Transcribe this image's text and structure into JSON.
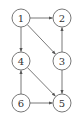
{
  "diagram": {
    "type": "directed-graph",
    "nodes": [
      {
        "id": "1",
        "label": "1",
        "x": 21,
        "y": 18
      },
      {
        "id": "2",
        "label": "2",
        "x": 62,
        "y": 18
      },
      {
        "id": "3",
        "label": "3",
        "x": 62,
        "y": 61
      },
      {
        "id": "4",
        "label": "4",
        "x": 21,
        "y": 61
      },
      {
        "id": "5",
        "label": "5",
        "x": 62,
        "y": 103
      },
      {
        "id": "6",
        "label": "6",
        "x": 21,
        "y": 103
      }
    ],
    "edges": [
      {
        "from": "1",
        "to": "2"
      },
      {
        "from": "1",
        "to": "4"
      },
      {
        "from": "1",
        "to": "3"
      },
      {
        "from": "3",
        "to": "2"
      },
      {
        "from": "3",
        "to": "5"
      },
      {
        "from": "4",
        "to": "5"
      },
      {
        "from": "6",
        "to": "4"
      },
      {
        "from": "6",
        "to": "5"
      }
    ],
    "node_radius": 9,
    "colors": {
      "stroke": "#555555",
      "fill": "#ffffff",
      "text": "#333333"
    }
  }
}
